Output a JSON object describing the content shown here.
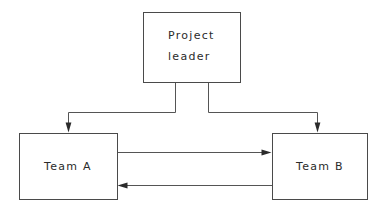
{
  "diagram": {
    "type": "organization-flow",
    "background_color": "#ffffff",
    "line_color": "#555555",
    "box_border_color": "#4a4a4a",
    "text_color": "#2b2b2b",
    "nodes": [
      {
        "id": "project-leader",
        "label_line_1": "Project",
        "label_line_2": "leader",
        "shape": "rectangle",
        "x": 143,
        "y": 12,
        "width": 97,
        "height": 70
      },
      {
        "id": "team-a",
        "label": "Team A",
        "shape": "rectangle",
        "x": 19,
        "y": 133,
        "width": 98,
        "height": 66
      },
      {
        "id": "team-b",
        "label": "Team B",
        "shape": "rectangle",
        "x": 272,
        "y": 133,
        "width": 95,
        "height": 66
      }
    ],
    "edges": [
      {
        "id": "leader-to-team-a",
        "from": "project-leader",
        "to": "team-a",
        "style": "elbow",
        "arrow": "end",
        "direction": "down-left"
      },
      {
        "id": "leader-to-team-b",
        "from": "project-leader",
        "to": "team-b",
        "style": "elbow",
        "arrow": "end",
        "direction": "down-right"
      },
      {
        "id": "team-a-to-team-b",
        "from": "team-a",
        "to": "team-b",
        "style": "straight",
        "arrow": "end",
        "direction": "right"
      },
      {
        "id": "team-b-to-team-a",
        "from": "team-b",
        "to": "team-a",
        "style": "straight",
        "arrow": "end",
        "direction": "left"
      }
    ]
  }
}
